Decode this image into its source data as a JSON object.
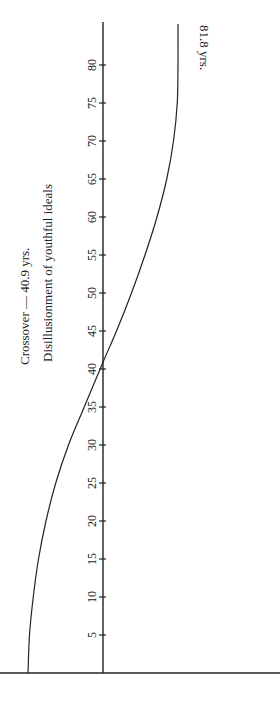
{
  "chart_data": {
    "type": "line",
    "orientation": "rotated-90",
    "title": "",
    "xlabel": "Age (years)",
    "ylabel": "",
    "x_ticks": [
      5,
      10,
      15,
      20,
      25,
      30,
      35,
      40,
      45,
      50,
      55,
      60,
      65,
      70,
      75,
      80
    ],
    "x_tick_labels": [
      "5",
      "10",
      "15",
      "20",
      "25",
      "30",
      "35",
      "40",
      "45",
      "50",
      "55",
      "60",
      "65",
      "70",
      "75",
      "80"
    ],
    "xlim": [
      0,
      84
    ],
    "ylim": [
      -1,
      1
    ],
    "series": [
      {
        "name": "curve",
        "x": [
          0,
          5,
          10,
          15,
          20,
          25,
          30,
          35,
          40.9,
          45,
          50,
          55,
          60,
          65,
          70,
          75,
          80,
          81.8
        ],
        "y": [
          -1.0,
          -0.98,
          -0.93,
          -0.86,
          -0.76,
          -0.63,
          -0.46,
          -0.25,
          0.0,
          0.18,
          0.38,
          0.56,
          0.72,
          0.85,
          0.94,
          0.99,
          1.0,
          1.0
        ]
      }
    ],
    "annotations": {
      "crossover": "Crossover — 40.9 yrs.",
      "disillusionment": "Disillusionment of youthful ideals",
      "end_label": "81.8 yrs."
    },
    "grid": false,
    "legend": "none"
  }
}
